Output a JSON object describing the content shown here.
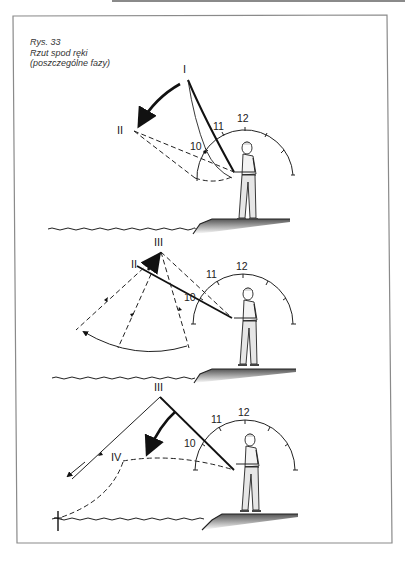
{
  "page": {
    "caption": {
      "figure_number": "Rys. 33",
      "title": "Rzut spod ręki",
      "subtitle": "(poszczególne fazy)"
    }
  },
  "figure": {
    "frame_color": "#8a8a8a",
    "ink_color": "#1a1a1a",
    "panels": [
      {
        "name": "phase-1",
        "phase_labels": [
          "I",
          "II"
        ],
        "clock_labels": [
          "10",
          "11",
          "12"
        ]
      },
      {
        "name": "phase-2",
        "phase_labels": [
          "III",
          "II"
        ],
        "clock_labels": [
          "10",
          "11",
          "12"
        ]
      },
      {
        "name": "phase-3",
        "phase_labels": [
          "III",
          "IV"
        ],
        "clock_labels": [
          "10",
          "11",
          "12"
        ]
      }
    ]
  }
}
